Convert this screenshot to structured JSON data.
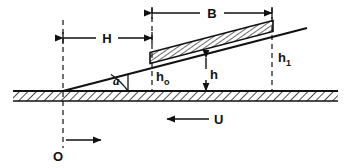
{
  "figure": {
    "background_color": "#ffffff",
    "line_color": "#111111"
  },
  "labels": {
    "B": "B",
    "H": "H",
    "alpha": "a",
    "h_main": "h",
    "h0_base": "h",
    "h0_sub": "o",
    "h1_base": "h",
    "h1_sub": "1",
    "U": "U",
    "O": "O"
  },
  "annotations": [
    {
      "name": "bearing-length",
      "text": "B",
      "role": "dimension",
      "x": 212,
      "y": 17
    },
    {
      "name": "inlet-distance",
      "text": "H",
      "role": "dimension",
      "x": 106,
      "y": 42
    },
    {
      "name": "inclination-angle",
      "text": "a",
      "role": "angle",
      "x": 115,
      "y": 84
    },
    {
      "name": "film-thickness",
      "text": "h",
      "role": "variable",
      "x": 212,
      "y": 80
    },
    {
      "name": "outlet-film-thickness",
      "text": "ho",
      "role": "variable",
      "x": 158,
      "y": 82
    },
    {
      "name": "inlet-film-thickness",
      "text": "h1",
      "role": "variable",
      "x": 281,
      "y": 63
    },
    {
      "name": "surface-velocity",
      "text": "U",
      "role": "velocity",
      "x": 217,
      "y": 124
    },
    {
      "name": "origin",
      "text": "O",
      "role": "origin",
      "x": 58,
      "y": 160
    }
  ],
  "geometry": {
    "ground_y": 91,
    "origin_x": 63,
    "slider_left_x": 152,
    "slider_right_x": 272,
    "incline_end_x": 307,
    "incline_end_y": 28,
    "B_dim_y": 13,
    "H_dim_y": 38,
    "U_arrow_y": 119,
    "O_arrow_y": 140
  },
  "colors": {
    "stroke": "#111111",
    "background": "#ffffff"
  }
}
